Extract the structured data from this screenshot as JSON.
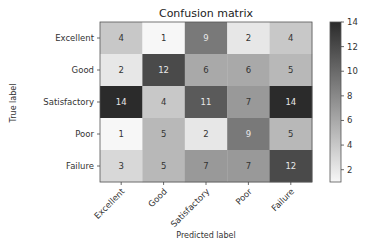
{
  "chart_data": {
    "type": "heatmap",
    "title": "Confusion matrix",
    "xlabel": "Predicted label",
    "ylabel": "True label",
    "x_categories": [
      "Excellent",
      "Good",
      "Satisfactory",
      "Poor",
      "Failure"
    ],
    "y_categories": [
      "Excellent",
      "Good",
      "Satisfactory",
      "Poor",
      "Failure"
    ],
    "values": [
      [
        4,
        1,
        9,
        2,
        4
      ],
      [
        2,
        12,
        6,
        6,
        5
      ],
      [
        14,
        4,
        11,
        7,
        14
      ],
      [
        1,
        5,
        2,
        9,
        5
      ],
      [
        3,
        5,
        7,
        7,
        12
      ]
    ],
    "colormap": "greys",
    "color_low": "#f7f7f7",
    "color_high": "#2b2b2b",
    "value_range": [
      1,
      14
    ],
    "colorbar": {
      "ticks": [
        2,
        4,
        6,
        8,
        10,
        12,
        14
      ],
      "placement": "right"
    },
    "text_color_dark": "#333333",
    "text_color_light": "#e8e8e8"
  }
}
